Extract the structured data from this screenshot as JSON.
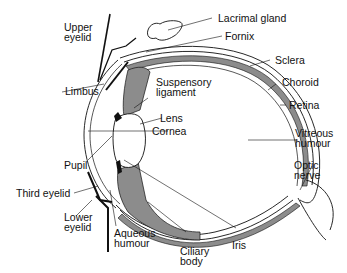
{
  "diagram": {
    "title": "",
    "colors": {
      "stroke": "#111111",
      "fill_grey": "#8c8c8c",
      "background": "#ffffff"
    },
    "labels": {
      "upper_eyelid": "Upper\neyelid",
      "lacrimal_gland": "Lacrimal gland",
      "fornix": "Fornix",
      "sclera": "Sclera",
      "choroid": "Choroid",
      "retina": "Retina",
      "limbus": "Limbus",
      "suspensory_ligament": "Suspensory\nligament",
      "lens": "Lens",
      "cornea": "Cornea",
      "vitreous_humour": "Vitreous\nhumour",
      "pupil": "Pupil",
      "optic_nerve": "Optic\nnerve",
      "third_eyelid": "Third eyelid",
      "lower_eyelid": "Lower\neyelid",
      "aqueous_humour": "Aqueous\nhumour",
      "iris": "Iris",
      "ciliary_body": "Ciliary\nbody"
    }
  }
}
